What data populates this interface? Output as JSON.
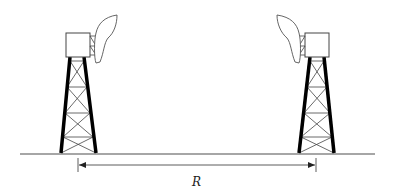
{
  "diagram": {
    "type": "two-tower-antenna-link",
    "distance_label": "R",
    "colors": {
      "background": "#ffffff",
      "line": "#333333",
      "ground": "#888888",
      "leg": "#000000"
    },
    "towers": [
      {
        "id": "left",
        "antenna_facing": "right",
        "box": {
          "x": 66,
          "y": 33,
          "w": 24,
          "h": 24
        },
        "legs": {
          "top_left": [
            70,
            57
          ],
          "top_right": [
            84,
            57
          ],
          "bottom_left": [
            61,
            153
          ],
          "bottom_right": [
            96,
            153
          ]
        }
      },
      {
        "id": "right",
        "antenna_facing": "left",
        "box": {
          "x": 305,
          "y": 33,
          "w": 24,
          "h": 24
        },
        "legs": {
          "top_left": [
            310,
            57
          ],
          "top_right": [
            324,
            57
          ],
          "bottom_left": [
            299,
            153
          ],
          "bottom_right": [
            334,
            153
          ]
        }
      }
    ],
    "ground": {
      "x1": 20,
      "x2": 375,
      "y": 154
    },
    "dimension": {
      "x1": 78,
      "x2": 316,
      "y": 165
    }
  }
}
